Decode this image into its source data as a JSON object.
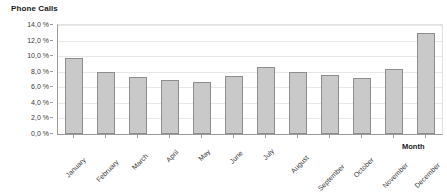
{
  "chart_data": {
    "type": "bar",
    "title": "Phone Calls",
    "xlabel": "Month",
    "ylabel": "",
    "categories": [
      "January",
      "February",
      "March",
      "April",
      "May",
      "June",
      "July",
      "August",
      "September",
      "October",
      "November",
      "December"
    ],
    "values": [
      9.7,
      8.0,
      7.3,
      7.0,
      6.7,
      7.4,
      8.6,
      8.0,
      7.6,
      7.2,
      8.4,
      13.0
    ],
    "ylim": [
      0.0,
      14.0
    ],
    "y_ticks": [
      0.0,
      2.0,
      4.0,
      6.0,
      8.0,
      10.0,
      12.0,
      14.0
    ],
    "y_tick_labels": [
      "0,0 %",
      "2,0 %",
      "4,0 %",
      "6,0 %",
      "8,0 %",
      "10,0 %",
      "12,0 %",
      "14,0 %"
    ],
    "grid": true,
    "legend": false,
    "series_name": "Phone Calls",
    "bar_color": "#c9c9c9",
    "bar_border_color": "#8d8d8d",
    "grid_color": "#e8e8e8",
    "axis_color": "#9a9a9a",
    "text_color": "#3a3a3a",
    "background_color": "#ffffff",
    "x_label_rotation": -45
  }
}
